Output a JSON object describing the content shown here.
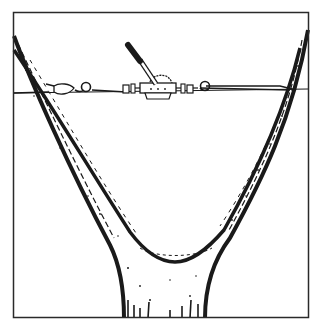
{
  "illustration": {
    "subject": "tree-crotch-cabling-with-come-along",
    "colors": {
      "background": "#ffffff",
      "ink": "#1a1a1a",
      "frame": "#2a2a2a"
    },
    "frame": {
      "x": 13,
      "y": 12,
      "width": 296,
      "height": 306
    },
    "elements": [
      {
        "name": "left-limb"
      },
      {
        "name": "right-limb"
      },
      {
        "name": "trunk"
      },
      {
        "name": "cable"
      },
      {
        "name": "left-anchor-shackle"
      },
      {
        "name": "left-hook"
      },
      {
        "name": "come-along-winch"
      },
      {
        "name": "winch-handle"
      },
      {
        "name": "right-hook"
      }
    ]
  }
}
